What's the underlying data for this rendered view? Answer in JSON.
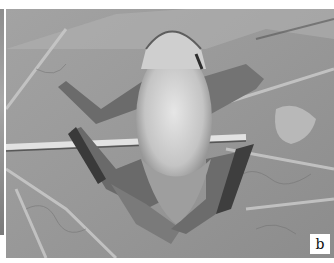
{
  "figure": {
    "panel_label": "b",
    "colors": {
      "leaf": "#9a9a9a",
      "frog_belly": "#d8d8d8",
      "frog_limbs": "#6f6f6f",
      "vein": "#c8c8c8",
      "stem": "#e0e0e0"
    }
  }
}
